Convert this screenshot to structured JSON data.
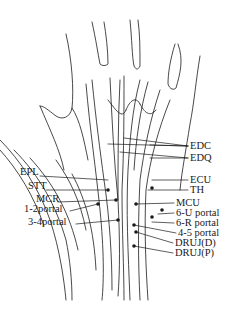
{
  "diagram": {
    "labels_left": [
      {
        "id": "epl",
        "text": "EPL",
        "x": 20,
        "y": 172
      },
      {
        "id": "stt",
        "text": "STT",
        "x": 28,
        "y": 186
      },
      {
        "id": "mcr",
        "text": "MCR",
        "x": 36,
        "y": 198
      },
      {
        "id": "p12",
        "text": "1-2portal",
        "x": 24,
        "y": 207
      },
      {
        "id": "p34",
        "text": "3-4portal",
        "x": 28,
        "y": 220
      }
    ],
    "labels_right": [
      {
        "id": "edc",
        "text": "EDC",
        "x": 190,
        "y": 141
      },
      {
        "id": "edq",
        "text": "EDQ",
        "x": 190,
        "y": 153
      },
      {
        "id": "ecu",
        "text": "ECU",
        "x": 190,
        "y": 176
      },
      {
        "id": "th",
        "text": "TH",
        "x": 190,
        "y": 186
      },
      {
        "id": "mcu",
        "text": "MCU",
        "x": 176,
        "y": 199
      },
      {
        "id": "p6u",
        "text": "6-U portal",
        "x": 176,
        "y": 209
      },
      {
        "id": "p6r",
        "text": "6-R portal",
        "x": 176,
        "y": 219
      },
      {
        "id": "p45",
        "text": "4-5 portal",
        "x": 178,
        "y": 229
      },
      {
        "id": "drujd",
        "text": "DRUJ(D)",
        "x": 175,
        "y": 239
      },
      {
        "id": "drujp",
        "text": "DRUJ(P)",
        "x": 175,
        "y": 249
      }
    ],
    "colors": {
      "line": "#1a1a1a",
      "background": "#ffffff"
    }
  }
}
